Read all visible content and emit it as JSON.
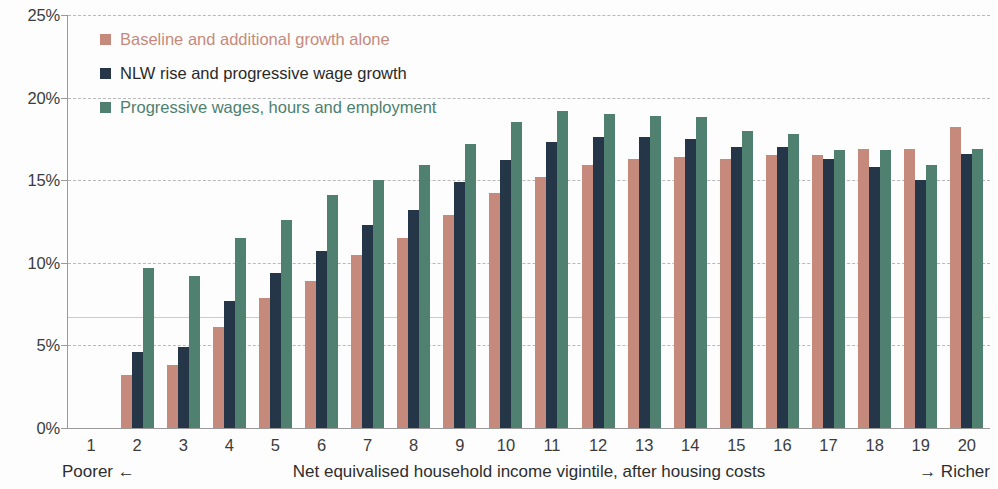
{
  "chart_data": {
    "type": "bar",
    "title": "",
    "xlabel": "Net equivalised household income vigintile, after housing costs",
    "ylabel": "",
    "ylim": [
      0,
      25
    ],
    "y_ticks": [
      0,
      5,
      10,
      15,
      20,
      25
    ],
    "y_tick_labels": [
      "0%",
      "5%",
      "10%",
      "15%",
      "20%",
      "25%"
    ],
    "grid": true,
    "legend_position": "top-left",
    "categories": [
      "1",
      "2",
      "3",
      "4",
      "5",
      "6",
      "7",
      "8",
      "9",
      "10",
      "11",
      "12",
      "13",
      "14",
      "15",
      "16",
      "17",
      "18",
      "19",
      "20"
    ],
    "series": [
      {
        "name": "Baseline and additional growth alone",
        "color": "#c68a7d",
        "values": [
          0,
          3.2,
          3.8,
          6.1,
          7.9,
          8.9,
          10.5,
          11.5,
          12.9,
          14.2,
          15.2,
          15.9,
          16.3,
          16.4,
          16.3,
          16.5,
          16.5,
          16.9,
          16.9,
          18.2
        ]
      },
      {
        "name": "NLW rise and progressive wage growth",
        "color": "#253648",
        "values": [
          0,
          4.6,
          4.9,
          7.7,
          9.4,
          10.7,
          12.3,
          13.2,
          14.9,
          16.2,
          17.3,
          17.6,
          17.6,
          17.5,
          17.0,
          17.0,
          16.3,
          15.8,
          15.0,
          16.6
        ]
      },
      {
        "name": "Progressive wages, hours and employment",
        "color": "#4f8070",
        "values": [
          0,
          9.7,
          9.2,
          11.5,
          12.6,
          14.1,
          15.0,
          15.9,
          17.2,
          18.5,
          19.2,
          19.0,
          18.9,
          18.8,
          18.0,
          17.8,
          16.8,
          16.8,
          15.9,
          16.9
        ]
      }
    ],
    "reference_line": {
      "value": 6.7,
      "color": "#e8a79d"
    },
    "annotations": {
      "left_direction": "Poorer ←",
      "right_direction": "→ Richer"
    }
  },
  "legend": {
    "items": [
      {
        "label": "Baseline and additional growth alone",
        "icon": "square-swatch"
      },
      {
        "label": "NLW rise and progressive wage growth",
        "icon": "square-swatch"
      },
      {
        "label": "Progressive wages, hours and employment",
        "icon": "square-swatch"
      }
    ]
  }
}
